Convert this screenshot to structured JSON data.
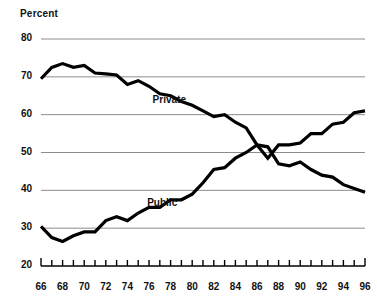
{
  "chart_data": {
    "type": "line",
    "title": "",
    "xlabel": "",
    "ylabel": "Percent",
    "ylim": [
      20,
      80
    ],
    "xlim": [
      66,
      96
    ],
    "yticks": [
      20,
      30,
      40,
      50,
      60,
      70,
      80
    ],
    "xticks": [
      66,
      67,
      68,
      69,
      70,
      71,
      72,
      73,
      74,
      75,
      76,
      77,
      78,
      79,
      80,
      81,
      82,
      83,
      84,
      85,
      86,
      87,
      88,
      89,
      90,
      91,
      92,
      93,
      94,
      95,
      96
    ],
    "xtick_labels": [
      "66",
      "",
      "68",
      "",
      "70",
      "",
      "72",
      "",
      "74",
      "",
      "76",
      "",
      "78",
      "",
      "80",
      "",
      "82",
      "",
      "84",
      "",
      "86",
      "",
      "88",
      "",
      "90",
      "",
      "92",
      "",
      "94",
      "",
      "96"
    ],
    "grid": true,
    "grid_axis": "y",
    "legend": "inline-annotation",
    "x": [
      66,
      67,
      68,
      69,
      70,
      71,
      72,
      73,
      74,
      75,
      76,
      77,
      78,
      79,
      80,
      81,
      82,
      83,
      84,
      85,
      86,
      87,
      88,
      89,
      90,
      91,
      92,
      93,
      94,
      95,
      96
    ],
    "series": [
      {
        "name": "Private",
        "color": "#000000",
        "values": [
          69.5,
          72.5,
          73.5,
          72.5,
          73.0,
          71.0,
          70.8,
          70.5,
          68.0,
          69.0,
          67.5,
          65.5,
          65.0,
          63.5,
          62.5,
          61.0,
          59.5,
          60.0,
          58.0,
          56.5,
          52.0,
          51.5,
          47.0,
          46.5,
          47.5,
          45.5,
          44.0,
          43.5,
          41.5,
          40.5,
          39.5
        ]
      },
      {
        "name": "Public",
        "color": "#000000",
        "values": [
          30.5,
          27.5,
          26.5,
          28.0,
          29.0,
          29.0,
          32.0,
          33.0,
          32.0,
          34.0,
          35.5,
          35.5,
          37.5,
          37.5,
          39.0,
          42.0,
          45.5,
          46.0,
          48.5,
          50.0,
          52.0,
          48.5,
          52.0,
          52.0,
          52.5,
          55.0,
          55.0,
          57.5,
          58.0,
          60.5,
          61.0
        ]
      }
    ],
    "annotations": [
      {
        "text": "Private",
        "x": 78.0,
        "y": 63.5
      },
      {
        "text": "Public",
        "x": 77.5,
        "y": 36.5
      }
    ]
  },
  "axis": {
    "y_label": "Percent",
    "y_tick_labels": [
      "80",
      "70",
      "60",
      "50",
      "40",
      "30",
      "20"
    ],
    "x_tick_labels": [
      "66",
      "68",
      "70",
      "72",
      "74",
      "76",
      "78",
      "80",
      "82",
      "84",
      "86",
      "88",
      "90",
      "92",
      "94",
      "96"
    ]
  },
  "style": {
    "line_color": "#000000",
    "grid_color": "#8c8c8c",
    "axis_color": "#000000",
    "background": "#ffffff",
    "text_color": "#111111"
  }
}
